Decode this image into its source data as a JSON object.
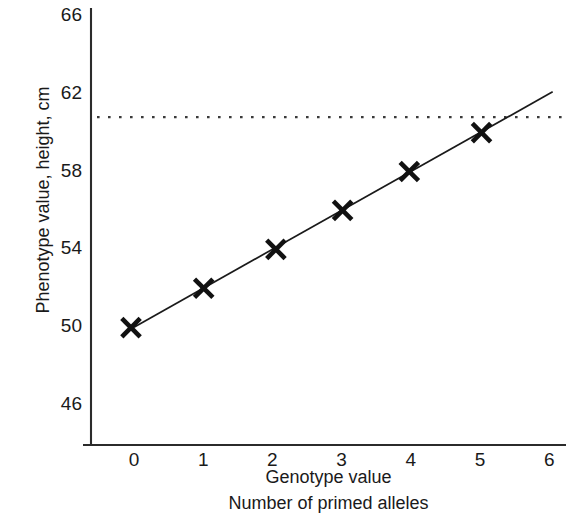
{
  "chart_data": {
    "type": "scatter",
    "title": "",
    "subtitle": "",
    "xlabel": "Genotype value",
    "xlabel_line2": "Number of primed alleles",
    "ylabel": "Phenotype value, height, cm",
    "x": [
      0,
      1,
      2,
      3,
      4,
      5
    ],
    "values": [
      49.9,
      51.9,
      53.9,
      55.9,
      57.9,
      59.9
    ],
    "series": [
      {
        "name": "Phenotype value",
        "marker": "x",
        "values": [
          49.9,
          51.9,
          53.9,
          55.9,
          57.9,
          59.9
        ]
      }
    ],
    "trend_line": {
      "type": "line",
      "intercept": 49.9,
      "slope": 2.0,
      "x_from": 0,
      "x_to": 6.05,
      "color": "#1a1a1a"
    },
    "reference_line": {
      "orientation": "horizontal",
      "value": 60.7,
      "style": "dotted",
      "color": "#3a3a3a"
    },
    "xlim": [
      -0.62,
      6.25
    ],
    "ylim": [
      44.0,
      66.9
    ],
    "xticks": [
      "0",
      "1",
      "2",
      "3",
      "4",
      "5",
      "6"
    ],
    "xtick_values": [
      0,
      1,
      2,
      3,
      4,
      5,
      6
    ],
    "yticks": [
      "46",
      "50",
      "54",
      "58",
      "62",
      "66"
    ],
    "ytick_values": [
      46,
      50,
      54,
      58,
      62,
      66
    ],
    "grid": false,
    "legend": null,
    "legend_position": "none",
    "axis_color": "#2b2b2b",
    "marker_color": "#111111",
    "background": "#ffffff"
  }
}
